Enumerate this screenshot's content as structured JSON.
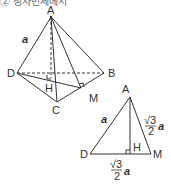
{
  "header": {
    "text": "② 정사면체에서"
  },
  "pyramid": {
    "points": {
      "A": "A",
      "B": "B",
      "C": "C",
      "D": "D",
      "H": "H",
      "M": "M"
    },
    "edge_label": "a"
  },
  "triangle": {
    "points": {
      "A": "A",
      "D": "D",
      "H": "H",
      "M": "M"
    },
    "side_AD": "a",
    "side_AM_num": "√3",
    "side_AM_den": "2",
    "side_AM_var": "a",
    "side_DM_num": "√3",
    "side_DM_den": "2",
    "side_DM_var": "a"
  },
  "colors": {
    "line": "#333333",
    "label": "#333333"
  }
}
